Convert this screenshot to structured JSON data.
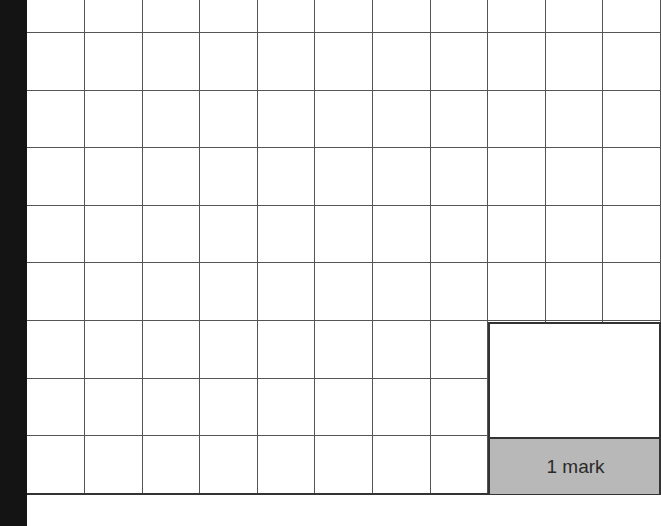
{
  "answer_grid": {
    "columns": 11,
    "rows": 9,
    "cell_size_px": 57.6,
    "line_color": "#555555"
  },
  "mark_box": {
    "label": "1 mark",
    "label_background": "#b8b8b8",
    "answer_value": ""
  },
  "binding_edge_color": "#141414"
}
